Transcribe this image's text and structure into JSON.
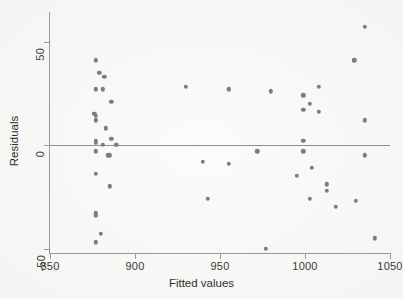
{
  "chart_data": {
    "type": "scatter",
    "title": "",
    "xlabel": "Fitted values",
    "ylabel": "Residuals",
    "xlim": [
      850,
      1050
    ],
    "ylim": [
      -50,
      60
    ],
    "xticks": [
      850,
      900,
      950,
      1000,
      1050
    ],
    "yticks": [
      50,
      0,
      -50
    ],
    "grid": false,
    "legend": null,
    "reference_lines": [
      {
        "axis": "y",
        "value": 0
      }
    ],
    "marker": {
      "shape": "circle",
      "color": "#7c7c7c",
      "size": 4
    },
    "points": [
      {
        "x": 877,
        "y": 41
      },
      {
        "x": 879,
        "y": 35
      },
      {
        "x": 882,
        "y": 33
      },
      {
        "x": 881,
        "y": 27
      },
      {
        "x": 877,
        "y": 27
      },
      {
        "x": 886,
        "y": 21
      },
      {
        "x": 876,
        "y": 15
      },
      {
        "x": 877,
        "y": 14
      },
      {
        "x": 877,
        "y": 12
      },
      {
        "x": 883,
        "y": 8
      },
      {
        "x": 877,
        "y": 2
      },
      {
        "x": 877,
        "y": 1
      },
      {
        "x": 881,
        "y": 0
      },
      {
        "x": 886,
        "y": 3
      },
      {
        "x": 889,
        "y": 0
      },
      {
        "x": 877,
        "y": -3
      },
      {
        "x": 884,
        "y": -5
      },
      {
        "x": 885,
        "y": -5
      },
      {
        "x": 877,
        "y": -14
      },
      {
        "x": 885,
        "y": -20
      },
      {
        "x": 877,
        "y": -33
      },
      {
        "x": 877,
        "y": -34
      },
      {
        "x": 880,
        "y": -43
      },
      {
        "x": 877,
        "y": -47
      },
      {
        "x": 930,
        "y": 28
      },
      {
        "x": 940,
        "y": -8
      },
      {
        "x": 943,
        "y": -26
      },
      {
        "x": 955,
        "y": 27
      },
      {
        "x": 955,
        "y": -9
      },
      {
        "x": 972,
        "y": -3
      },
      {
        "x": 977,
        "y": -50
      },
      {
        "x": 980,
        "y": 26
      },
      {
        "x": 995,
        "y": -15
      },
      {
        "x": 999,
        "y": 24
      },
      {
        "x": 999,
        "y": 17
      },
      {
        "x": 999,
        "y": 2
      },
      {
        "x": 999,
        "y": -3
      },
      {
        "x": 1003,
        "y": 20
      },
      {
        "x": 1004,
        "y": -11
      },
      {
        "x": 1003,
        "y": -26
      },
      {
        "x": 1008,
        "y": 28
      },
      {
        "x": 1008,
        "y": 16
      },
      {
        "x": 1013,
        "y": -19
      },
      {
        "x": 1013,
        "y": -22
      },
      {
        "x": 1018,
        "y": -30
      },
      {
        "x": 1029,
        "y": 41
      },
      {
        "x": 1030,
        "y": -27
      },
      {
        "x": 1035,
        "y": 57
      },
      {
        "x": 1035,
        "y": 12
      },
      {
        "x": 1035,
        "y": -5
      },
      {
        "x": 1041,
        "y": -45
      }
    ]
  },
  "axis": {
    "y_tick_labels": [
      "50",
      "0",
      "-50"
    ],
    "x_tick_labels": [
      "850",
      "900",
      "950",
      "1000",
      "1050"
    ],
    "y_title": "Residuals",
    "x_title": "Fitted values"
  }
}
